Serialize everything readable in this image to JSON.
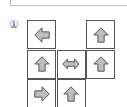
{
  "label": "①",
  "arrow_fill": "#bdbdbd",
  "arrow_stroke": "#555555",
  "grid": {
    "rows": 3,
    "cols": 3,
    "cells": [
      {
        "row": 0,
        "col": 0,
        "arrow": "left"
      },
      {
        "row": 0,
        "col": 2,
        "arrow": "up"
      },
      {
        "row": 1,
        "col": 0,
        "arrow": "up"
      },
      {
        "row": 1,
        "col": 1,
        "arrow": "left-right"
      },
      {
        "row": 1,
        "col": 2,
        "arrow": "up"
      },
      {
        "row": 2,
        "col": 0,
        "arrow": "right"
      },
      {
        "row": 2,
        "col": 1,
        "arrow": "up"
      }
    ]
  }
}
